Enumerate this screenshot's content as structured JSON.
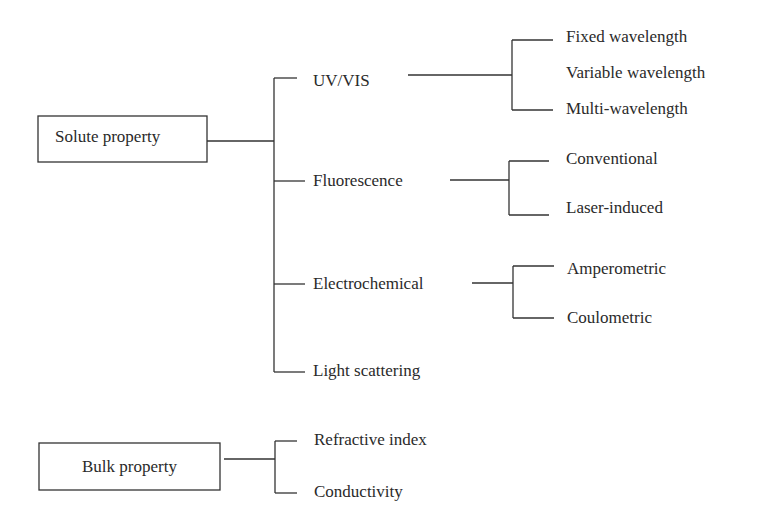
{
  "diagram": {
    "type": "tree",
    "roots": [
      {
        "label": "Solute property",
        "children": [
          {
            "label": "UV/VIS",
            "children": [
              "Fixed wavelength",
              "Variable wavelength",
              "Multi-wavelength"
            ]
          },
          {
            "label": "Fluorescence",
            "children": [
              "Conventional",
              "Laser-induced"
            ]
          },
          {
            "label": "Electrochemical",
            "children": [
              "Amperometric",
              "Coulometric"
            ]
          },
          {
            "label": "Light scattering",
            "children": []
          }
        ]
      },
      {
        "label": "Bulk property",
        "children": [
          {
            "label": "Refractive index",
            "children": []
          },
          {
            "label": "Conductivity",
            "children": []
          }
        ]
      }
    ]
  }
}
